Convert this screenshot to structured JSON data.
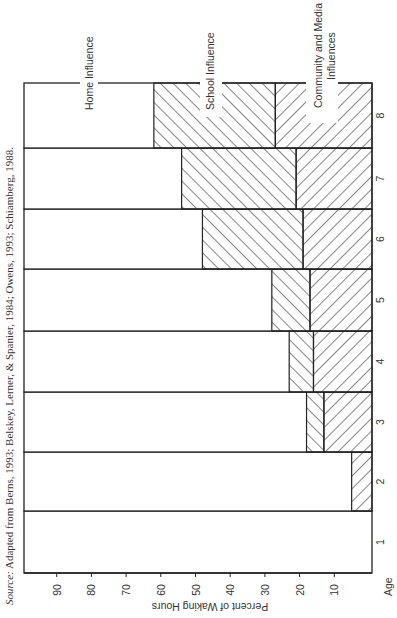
{
  "chart_data": {
    "type": "bar",
    "orientation": "stacked-bar, printed rotated 90° (age axis runs vertically, percent axis runs horizontally)",
    "title": "",
    "xlabel": "Age",
    "ylabel": "Percent of Waking Hours",
    "categories": [
      "1",
      "2",
      "3",
      "4",
      "5",
      "6",
      "7",
      "8"
    ],
    "ylim": [
      0,
      100
    ],
    "yticks": [
      10,
      20,
      30,
      40,
      50,
      60,
      70,
      80,
      90
    ],
    "grid": false,
    "series": [
      {
        "name": "Community and Media Influences",
        "pattern": "hatch-forward",
        "values": [
          0,
          5,
          13,
          16,
          17,
          19,
          21,
          27
        ]
      },
      {
        "name": "School Influence",
        "pattern": "hatch-backward",
        "values": [
          0,
          0,
          5,
          7,
          11,
          29,
          33,
          35
        ]
      },
      {
        "name": "Home Influence",
        "pattern": "none",
        "values": [
          100,
          95,
          82,
          77,
          72,
          52,
          46,
          38
        ]
      }
    ],
    "legend": {
      "position": "inline labels above age-8 bar",
      "entries": [
        "Home Influence",
        "School Influence",
        "Community and Media Influences"
      ]
    },
    "source": "Source: Adapted from Berns, 1993; Belskey, Lerner, & Spanier, 1984; Owens, 1993; Schiamberg, 1988."
  },
  "labels": {
    "home": "Home Influence",
    "school": "School Influence",
    "community_line1": "Community and Media",
    "community_line2": "Influences",
    "axis_title": "Percent of Waking Hours",
    "age": "Age",
    "source_italic": "Source:",
    "source_rest": " Adapted from Berns, 1993; Belskey, Lerner, & Spanier, 1984; Owens, 1993; Schiamberg, 1988."
  },
  "colors": {
    "ink": "#222222",
    "background": "#ffffff"
  }
}
